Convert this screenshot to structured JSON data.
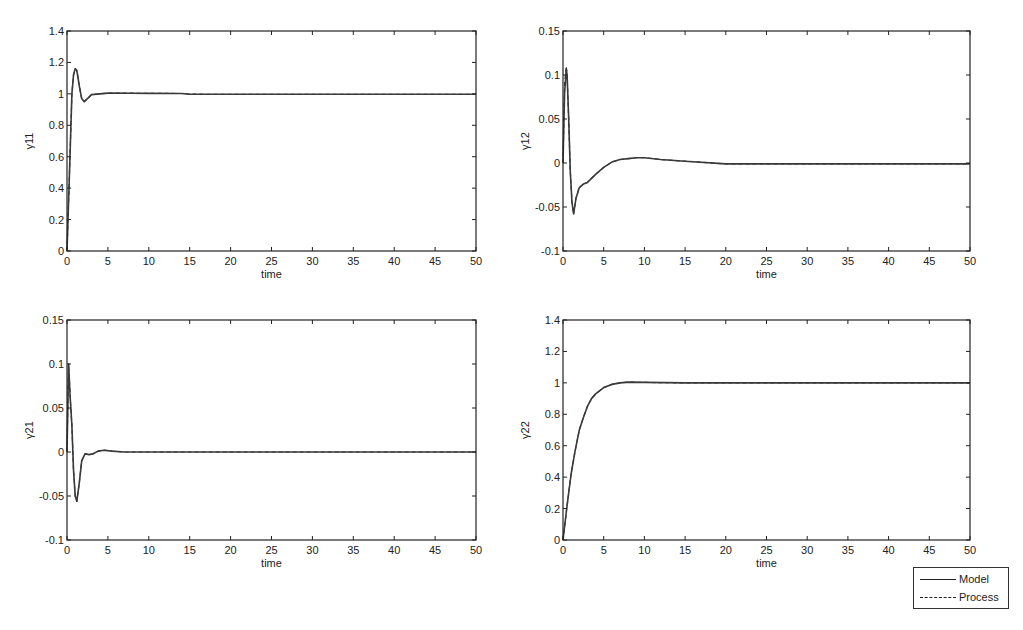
{
  "chart_data": [
    {
      "type": "line",
      "id": "g11",
      "title": "",
      "xlabel": "time",
      "ylabel": "γ11",
      "xlim": [
        0,
        50
      ],
      "ylim": [
        0,
        1.4
      ],
      "xticks": [
        0,
        5,
        10,
        15,
        20,
        25,
        30,
        35,
        40,
        45,
        50
      ],
      "yticks": [
        0,
        0.2,
        0.4,
        0.6,
        0.8,
        1,
        1.2,
        1.4
      ],
      "ytick_labels": [
        "0",
        "0.2",
        "0.4",
        "0.6",
        "0.8",
        "1",
        "1.2",
        "1.4"
      ],
      "grid": false,
      "series": [
        {
          "name": "Model",
          "style": "solid",
          "x": [
            0,
            0.3,
            0.6,
            0.8,
            1.0,
            1.2,
            1.5,
            1.8,
            2.1,
            2.5,
            3,
            4,
            5,
            8,
            10,
            14,
            15,
            20,
            30,
            40,
            50
          ],
          "y": [
            0,
            0.5,
            1.0,
            1.12,
            1.16,
            1.15,
            1.05,
            0.97,
            0.95,
            0.97,
            0.995,
            1.0,
            1.005,
            1.004,
            1.003,
            1.002,
            0.998,
            0.997,
            0.997,
            0.997,
            0.997
          ]
        },
        {
          "name": "Process",
          "style": "dashed",
          "x": [
            0,
            0.3,
            0.6,
            0.8,
            1.0,
            1.2,
            1.5,
            1.8,
            2.1,
            2.5,
            3,
            4,
            5,
            8,
            10,
            14,
            15,
            20,
            30,
            40,
            50
          ],
          "y": [
            0,
            0.5,
            1.0,
            1.12,
            1.16,
            1.15,
            1.05,
            0.97,
            0.95,
            0.97,
            0.995,
            1.0,
            1.005,
            1.004,
            1.003,
            1.002,
            0.998,
            0.997,
            0.997,
            0.997,
            0.997
          ]
        }
      ]
    },
    {
      "type": "line",
      "id": "g12",
      "title": "",
      "xlabel": "time",
      "ylabel": "γ12",
      "xlim": [
        0,
        50
      ],
      "ylim": [
        -0.1,
        0.15
      ],
      "xticks": [
        0,
        5,
        10,
        15,
        20,
        25,
        30,
        35,
        40,
        45,
        50
      ],
      "yticks": [
        -0.1,
        -0.05,
        0,
        0.05,
        0.1,
        0.15
      ],
      "ytick_labels": [
        "-0.1",
        "-0.05",
        "0",
        "0.05",
        "0.1",
        "0.15"
      ],
      "grid": false,
      "series": [
        {
          "name": "Model",
          "style": "solid",
          "x": [
            0,
            0.2,
            0.4,
            0.5,
            0.7,
            0.9,
            1.1,
            1.3,
            1.6,
            2,
            2.5,
            3,
            4,
            5,
            6,
            7,
            8,
            9,
            10,
            12,
            15,
            20,
            30,
            40,
            50
          ],
          "y": [
            0,
            0.08,
            0.107,
            0.1,
            0.05,
            -0.01,
            -0.045,
            -0.058,
            -0.04,
            -0.028,
            -0.024,
            -0.022,
            -0.013,
            -0.005,
            0.001,
            0.004,
            0.005,
            0.006,
            0.006,
            0.004,
            0.002,
            -0.001,
            -0.001,
            -0.001,
            -0.001
          ]
        },
        {
          "name": "Process",
          "style": "dashed",
          "x": [
            0,
            0.2,
            0.4,
            0.5,
            0.7,
            0.9,
            1.1,
            1.3,
            1.6,
            2,
            2.5,
            3,
            4,
            5,
            6,
            7,
            8,
            9,
            10,
            12,
            15,
            20,
            30,
            40,
            50
          ],
          "y": [
            0,
            0.09,
            0.11,
            0.1,
            0.05,
            -0.01,
            -0.045,
            -0.058,
            -0.04,
            -0.028,
            -0.024,
            -0.022,
            -0.013,
            -0.005,
            0.001,
            0.004,
            0.005,
            0.006,
            0.006,
            0.004,
            0.002,
            -0.001,
            -0.001,
            -0.001,
            -0.001
          ]
        }
      ]
    },
    {
      "type": "line",
      "id": "g21",
      "title": "",
      "xlabel": "time",
      "ylabel": "γ21",
      "xlim": [
        0,
        50
      ],
      "ylim": [
        -0.1,
        0.15
      ],
      "xticks": [
        0,
        5,
        10,
        15,
        20,
        25,
        30,
        35,
        40,
        45,
        50
      ],
      "yticks": [
        -0.1,
        -0.05,
        0,
        0.05,
        0.1,
        0.15
      ],
      "ytick_labels": [
        "-0.1",
        "-0.05",
        "0",
        "0.05",
        "0.1",
        "0.15"
      ],
      "grid": false,
      "series": [
        {
          "name": "Model",
          "style": "solid",
          "x": [
            0,
            0.2,
            0.4,
            0.6,
            0.8,
            1.0,
            1.2,
            1.5,
            1.8,
            2.2,
            2.7,
            3.2,
            3.8,
            4.5,
            5.5,
            7,
            10,
            15,
            20,
            30,
            40,
            50
          ],
          "y": [
            0,
            0.1,
            0.06,
            0.03,
            -0.02,
            -0.05,
            -0.056,
            -0.035,
            -0.01,
            -0.002,
            -0.003,
            -0.002,
            0.001,
            0.002,
            0.001,
            0.0,
            0.0,
            0.0,
            0.0,
            0.0,
            0.0,
            0.0
          ]
        },
        {
          "name": "Process",
          "style": "dashed",
          "x": [
            0,
            0.2,
            0.4,
            0.6,
            0.8,
            1.0,
            1.2,
            1.5,
            1.8,
            2.2,
            2.7,
            3.2,
            3.8,
            4.5,
            5.5,
            7,
            10,
            15,
            20,
            30,
            40,
            50
          ],
          "y": [
            0,
            0.1,
            0.06,
            0.03,
            -0.02,
            -0.05,
            -0.056,
            -0.035,
            -0.01,
            -0.002,
            -0.003,
            -0.002,
            0.001,
            0.002,
            0.001,
            0.0,
            0.0,
            0.0,
            0.0,
            0.0,
            0.0,
            0.0
          ]
        }
      ]
    },
    {
      "type": "line",
      "id": "g22",
      "title": "",
      "xlabel": "time",
      "ylabel": "γ22",
      "xlim": [
        0,
        50
      ],
      "ylim": [
        0,
        1.4
      ],
      "xticks": [
        0,
        5,
        10,
        15,
        20,
        25,
        30,
        35,
        40,
        45,
        50
      ],
      "yticks": [
        0,
        0.2,
        0.4,
        0.6,
        0.8,
        1,
        1.2,
        1.4
      ],
      "ytick_labels": [
        "0",
        "0.2",
        "0.4",
        "0.6",
        "0.8",
        "1",
        "1.2",
        "1.4"
      ],
      "grid": false,
      "series": [
        {
          "name": "Model",
          "style": "solid",
          "x": [
            0,
            0.5,
            1,
            1.5,
            2,
            2.5,
            3,
            3.5,
            4,
            5,
            6,
            7,
            8,
            10,
            15,
            20,
            30,
            40,
            50
          ],
          "y": [
            0,
            0.22,
            0.42,
            0.57,
            0.7,
            0.78,
            0.85,
            0.9,
            0.93,
            0.97,
            0.99,
            1.0,
            1.005,
            1.003,
            1.0,
            1.0,
            1.0,
            1.0,
            1.0
          ]
        },
        {
          "name": "Process",
          "style": "dashed",
          "x": [
            0,
            0.5,
            1,
            1.5,
            2,
            2.5,
            3,
            3.5,
            4,
            5,
            6,
            7,
            8,
            10,
            15,
            20,
            30,
            40,
            50
          ],
          "y": [
            0,
            0.22,
            0.42,
            0.57,
            0.7,
            0.78,
            0.85,
            0.9,
            0.93,
            0.97,
            0.99,
            1.0,
            1.005,
            1.003,
            1.0,
            1.0,
            1.0,
            1.0,
            1.0
          ]
        }
      ]
    }
  ],
  "legend": {
    "position": "bottom-right",
    "entries": [
      {
        "label": "Model",
        "style": "solid"
      },
      {
        "label": "Process",
        "style": "dashed"
      }
    ]
  },
  "layout": {
    "axes": [
      {
        "left": 67,
        "top": 31,
        "right": 476,
        "bottom": 251
      },
      {
        "left": 563,
        "top": 31,
        "right": 970,
        "bottom": 251
      },
      {
        "left": 67,
        "top": 320,
        "right": 476,
        "bottom": 540
      },
      {
        "left": 563,
        "top": 320,
        "right": 970,
        "bottom": 540
      }
    ],
    "line_color": "#3a3a3a",
    "axis_color": "#222222"
  }
}
